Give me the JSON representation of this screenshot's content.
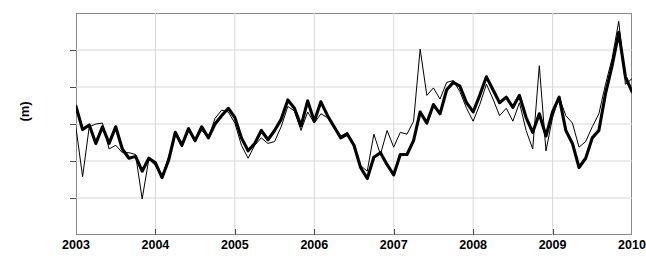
{
  "chart_data": {
    "type": "line",
    "title": "",
    "xlabel": "",
    "ylabel": "(m)",
    "xlim": [
      2003.0,
      2010.0
    ],
    "ylim": [
      -0.06,
      0.06
    ],
    "grid": true,
    "legend_position": "none",
    "yticks": [
      0.06,
      0.04,
      0.02,
      0,
      -0.02,
      -0.04,
      -0.06
    ],
    "ytick_labels": [
      "0.06",
      "0.04",
      "0.02",
      "0",
      "-0.02",
      "-0.04",
      "-0.06"
    ],
    "xticks": [
      2003,
      2004,
      2005,
      2006,
      2007,
      2008,
      2009,
      2010
    ],
    "xtick_labels": [
      "2003",
      "2004",
      "2005",
      "2006",
      "2007",
      "2008",
      "2009",
      "2010"
    ],
    "series": [
      {
        "name": "thick-series",
        "color": "#000000",
        "linewidth": 3.1,
        "x": [
          2003.0,
          2003.083,
          2003.167,
          2003.25,
          2003.333,
          2003.417,
          2003.5,
          2003.583,
          2003.667,
          2003.75,
          2003.833,
          2003.917,
          2004.0,
          2004.083,
          2004.167,
          2004.25,
          2004.333,
          2004.417,
          2004.5,
          2004.583,
          2004.667,
          2004.75,
          2004.833,
          2004.917,
          2005.0,
          2005.083,
          2005.167,
          2005.25,
          2005.333,
          2005.417,
          2005.5,
          2005.583,
          2005.667,
          2005.75,
          2005.833,
          2005.917,
          2006.0,
          2006.083,
          2006.167,
          2006.25,
          2006.333,
          2006.417,
          2006.5,
          2006.583,
          2006.667,
          2006.75,
          2006.833,
          2006.917,
          2007.0,
          2007.083,
          2007.167,
          2007.25,
          2007.333,
          2007.417,
          2007.5,
          2007.583,
          2007.667,
          2007.75,
          2007.833,
          2007.917,
          2008.0,
          2008.083,
          2008.167,
          2008.25,
          2008.333,
          2008.417,
          2008.5,
          2008.583,
          2008.667,
          2008.75,
          2008.833,
          2008.917,
          2009.0,
          2009.083,
          2009.167,
          2009.25,
          2009.333,
          2009.417,
          2009.5,
          2009.583,
          2009.667,
          2009.75,
          2009.833,
          2009.917,
          2010.0
        ],
        "values": [
          0.0095,
          -0.003,
          -0.0005,
          -0.0105,
          -0.0015,
          -0.0105,
          -0.0015,
          -0.0135,
          -0.0185,
          -0.0175,
          -0.0255,
          -0.0185,
          -0.021,
          -0.029,
          -0.0195,
          -0.0045,
          -0.0115,
          -0.0025,
          -0.009,
          -0.0015,
          -0.0075,
          0.0,
          0.0045,
          0.0085,
          0.0035,
          -0.0075,
          -0.0145,
          -0.0105,
          -0.0035,
          -0.0085,
          -0.0035,
          0.0025,
          0.013,
          0.0085,
          -0.001,
          0.0125,
          0.0015,
          0.012,
          0.0045,
          -0.0015,
          -0.0075,
          -0.0055,
          -0.0115,
          -0.0235,
          -0.0295,
          -0.018,
          -0.0155,
          -0.022,
          -0.0275,
          -0.0165,
          -0.0165,
          -0.009,
          0.0065,
          0.0005,
          0.0105,
          0.0055,
          0.0185,
          0.0225,
          0.0205,
          0.0115,
          0.0065,
          0.0155,
          0.0255,
          0.0185,
          0.0115,
          0.0145,
          0.009,
          0.0155,
          0.0035,
          -0.0045,
          0.0055,
          -0.0065,
          0.0065,
          0.0145,
          -0.0035,
          -0.0105,
          -0.0235,
          -0.0185,
          -0.0075,
          -0.0035,
          0.0165,
          0.0315,
          0.0495,
          0.0255,
          0.0175
        ]
      },
      {
        "name": "thin-series",
        "color": "#000000",
        "linewidth": 1.0,
        "x": [
          2003.0,
          2003.083,
          2003.167,
          2003.25,
          2003.333,
          2003.417,
          2003.5,
          2003.583,
          2003.667,
          2003.75,
          2003.833,
          2003.917,
          2004.0,
          2004.083,
          2004.167,
          2004.25,
          2004.333,
          2004.417,
          2004.5,
          2004.583,
          2004.667,
          2004.75,
          2004.833,
          2004.917,
          2005.0,
          2005.083,
          2005.167,
          2005.25,
          2005.333,
          2005.417,
          2005.5,
          2005.583,
          2005.667,
          2005.75,
          2005.833,
          2005.917,
          2006.0,
          2006.083,
          2006.167,
          2006.25,
          2006.333,
          2006.417,
          2006.5,
          2006.583,
          2006.667,
          2006.75,
          2006.833,
          2006.917,
          2007.0,
          2007.083,
          2007.167,
          2007.25,
          2007.333,
          2007.417,
          2007.5,
          2007.583,
          2007.667,
          2007.75,
          2007.833,
          2007.917,
          2008.0,
          2008.083,
          2008.167,
          2008.25,
          2008.333,
          2008.417,
          2008.5,
          2008.583,
          2008.667,
          2008.75,
          2008.833,
          2008.917,
          2009.0,
          2009.083,
          2009.167,
          2009.25,
          2009.333,
          2009.417,
          2009.5,
          2009.583,
          2009.667,
          2009.75,
          2009.833,
          2009.917,
          2010.0
        ],
        "values": [
          -0.002,
          -0.0285,
          -0.0015,
          0.0,
          0.0005,
          -0.0135,
          -0.0115,
          -0.0155,
          -0.0155,
          -0.0165,
          -0.0405,
          -0.019,
          -0.0225,
          -0.029,
          -0.0175,
          -0.005,
          -0.0125,
          -0.0035,
          -0.0085,
          -0.0035,
          -0.0075,
          0.003,
          0.0075,
          0.0065,
          0.0005,
          -0.0115,
          -0.0185,
          -0.0115,
          -0.0075,
          -0.0105,
          -0.0095,
          -0.0015,
          0.0095,
          0.007,
          -0.0035,
          0.0065,
          0.0005,
          0.0055,
          0.0035,
          -0.0025,
          -0.0065,
          -0.0045,
          -0.0125,
          -0.0225,
          -0.0255,
          -0.0055,
          -0.0165,
          -0.0035,
          -0.0125,
          -0.0045,
          -0.0055,
          0.0015,
          0.0405,
          0.0155,
          0.0195,
          0.0135,
          0.0225,
          0.0235,
          0.0175,
          0.0085,
          0.0015,
          0.0105,
          0.0215,
          0.0135,
          0.0045,
          0.0085,
          0.0015,
          0.0115,
          -0.0035,
          -0.0135,
          0.0315,
          -0.0145,
          0.0035,
          0.0145,
          0.0045,
          0.0005,
          -0.0125,
          -0.0095,
          -0.0015,
          0.0055,
          0.0215,
          0.0355,
          0.0555,
          0.0215,
          0.0245
        ]
      }
    ]
  }
}
